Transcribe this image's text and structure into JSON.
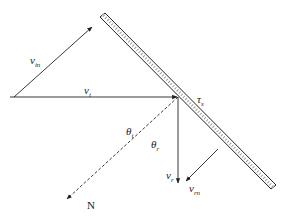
{
  "diagram": {
    "type": "vector-reflection-diagram",
    "labels": {
      "v_in": {
        "main": "v",
        "sub": "in"
      },
      "v_i": {
        "main": "v",
        "sub": "i"
      },
      "tau_s": {
        "main": "τ",
        "sub": "s"
      },
      "theta_i": {
        "main": "θ",
        "sub": "i"
      },
      "theta_r": {
        "main": "θ",
        "sub": "r"
      },
      "v_r": {
        "main": "v",
        "sub": "r"
      },
      "v_rn": {
        "main": "v",
        "sub": "rn"
      },
      "normal": "N"
    },
    "colors": {
      "line": "#222222",
      "surface_fill": "#cccccc",
      "background": "#ffffff"
    }
  }
}
